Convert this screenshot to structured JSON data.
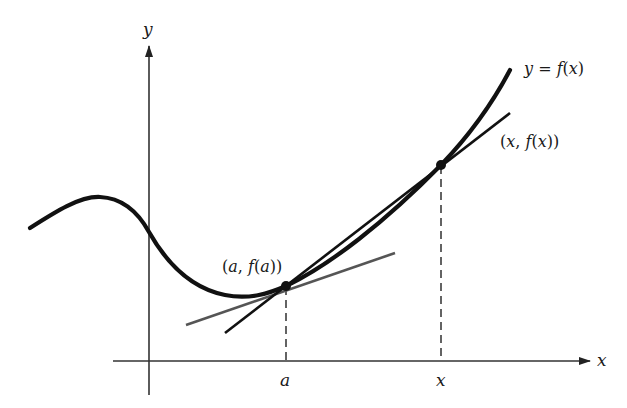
{
  "diagram": {
    "type": "secant-tangent illustration",
    "axes": {
      "x_label": "x",
      "y_label": "y"
    },
    "curve": {
      "label_lhs": "y",
      "label_eq": "=",
      "label_rhs": "f(x)"
    },
    "points": [
      {
        "id": "a",
        "label": "(a, f(a))",
        "tick_label": "a"
      },
      {
        "id": "x",
        "label": "(x, f(x))",
        "tick_label": "x"
      }
    ],
    "lines": [
      {
        "id": "tangent",
        "description": "tangent line at a",
        "color": "#555555"
      },
      {
        "id": "secant",
        "description": "secant line through (a, f(a)) and (x, f(x))",
        "color": "#111111"
      }
    ],
    "colors": {
      "curve": "#111111",
      "axis": "#333333",
      "tangent": "#555555",
      "secant": "#111111",
      "background": "#ffffff"
    }
  }
}
